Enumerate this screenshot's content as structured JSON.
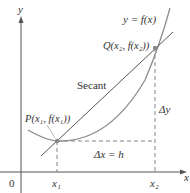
{
  "diagram": {
    "type": "secant-line-figure",
    "axes": {
      "x_label": "x",
      "y_label": "y",
      "origin_label": "0"
    },
    "curve_label": "y = f(x)",
    "secant_label": "Secant",
    "points": {
      "P": {
        "label": "P(x₁, f(x₁))",
        "x_label": "x₁"
      },
      "Q": {
        "label": "Q(x₂, f(x₂))",
        "x_label": "x₂"
      }
    },
    "delta_x_label": "Δx = h",
    "delta_y_label": "Δy",
    "colors": {
      "axis": "#555555",
      "curve": "#8c8c8c",
      "secant": "#555555",
      "dashed": "#777777",
      "point": "#888888",
      "text": "#333333"
    }
  }
}
